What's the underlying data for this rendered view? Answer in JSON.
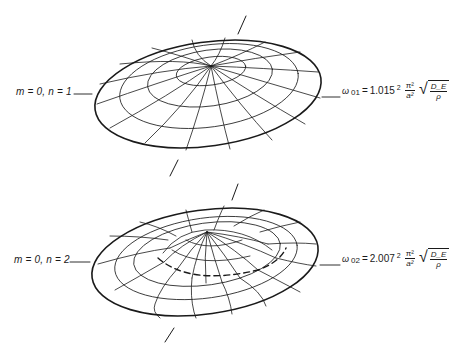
{
  "figure": {
    "modes": [
      {
        "id": "mode-01",
        "label": "m = 0, n = 1",
        "frequency": {
          "symbol": "ω",
          "subscript": "01",
          "equals": "=",
          "coefficient": "1.015",
          "coefficient_power": "2",
          "pi_fraction": {
            "numerator": "π²",
            "denominator": "a²"
          },
          "sqrt_fraction": {
            "numerator": "D_E",
            "denominator": "ρ"
          }
        },
        "shape": "dome"
      },
      {
        "id": "mode-02",
        "label": "m = 0, n = 2",
        "frequency": {
          "symbol": "ω",
          "subscript": "02",
          "equals": "=",
          "coefficient": "2.007",
          "coefficient_power": "2",
          "pi_fraction": {
            "numerator": "π²",
            "denominator": "a²"
          },
          "sqrt_fraction": {
            "numerator": "D_E",
            "denominator": "ρ"
          }
        },
        "shape": "dome-with-nodal-circle"
      }
    ],
    "line_color": "#1a1a1a",
    "background": "#ffffff"
  }
}
